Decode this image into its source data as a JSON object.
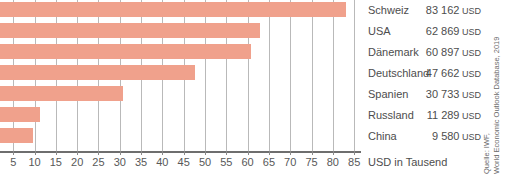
{
  "chart_data": {
    "type": "bar",
    "orientation": "horizontal",
    "title": "",
    "subtitle": "",
    "xlabel": "USD in Tausend",
    "ylabel": "",
    "xlim": [
      1.9,
      86.6
    ],
    "grid": true,
    "legend_position": "right-table",
    "xticks": [
      5,
      10,
      15,
      20,
      25,
      30,
      35,
      40,
      45,
      50,
      55,
      60,
      65,
      70,
      75,
      80,
      85
    ],
    "xtick_labels": [
      "5",
      "10",
      "15",
      "20",
      "25",
      "30",
      "35",
      "40",
      "45",
      "50",
      "55",
      "60",
      "65",
      "70",
      "75",
      "80",
      "85"
    ],
    "unit_label": "USD",
    "bar_color": "#f0a18c",
    "categories": [
      "Schweiz",
      "USA",
      "Dänemark",
      "Deutschland",
      "Spanien",
      "Russland",
      "China"
    ],
    "values": [
      83.162,
      62.869,
      60.897,
      47.662,
      30.733,
      11.289,
      9.58
    ],
    "value_labels": [
      "83 162",
      "62 869",
      "60 897",
      "47 662",
      "30 733",
      "11 289",
      "9 580"
    ],
    "rows": [
      {
        "category": "Schweiz",
        "value": 83.162,
        "value_label": "83 162",
        "unit": "USD"
      },
      {
        "category": "USA",
        "value": 62.869,
        "value_label": "62 869",
        "unit": "USD"
      },
      {
        "category": "Dänemark",
        "value": 60.897,
        "value_label": "60 897",
        "unit": "USD"
      },
      {
        "category": "Deutschland",
        "value": 47.662,
        "value_label": "47 662",
        "unit": "USD"
      },
      {
        "category": "Spanien",
        "value": 30.733,
        "value_label": "30 733",
        "unit": "USD"
      },
      {
        "category": "Russland",
        "value": 11.289,
        "value_label": "11 289",
        "unit": "USD"
      },
      {
        "category": "China",
        "value": 9.58,
        "value_label": "9 580",
        "unit": "USD"
      }
    ],
    "annotations": {
      "source_line_1": "Quelle: IWF,",
      "source_line_2": "World Economic Outlook Database, 2019"
    }
  }
}
